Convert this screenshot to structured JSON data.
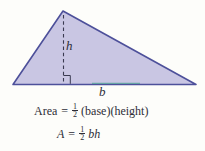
{
  "figure": {
    "type": "triangle-area-diagram",
    "triangle": {
      "fill": "#c9c6e3",
      "stroke": "#4d509a"
    },
    "height_label": "h",
    "base_label": "b",
    "formulas": [
      {
        "lhs": "Area",
        "equals": "=",
        "fraction": {
          "numerator": "1",
          "denominator": "2"
        },
        "rhs": "(base)(height)"
      },
      {
        "lhs": "A",
        "equals": "=",
        "fraction": {
          "numerator": "1",
          "denominator": "2"
        },
        "rhs": "bh"
      }
    ],
    "colors": {
      "triangle_fill": "#c9c6e3",
      "triangle_stroke": "#4d509a",
      "dash_line": "#3a3a50",
      "text": "#2e2e38",
      "base_tint": "#4aa392",
      "background": "#fdfdfa"
    }
  }
}
